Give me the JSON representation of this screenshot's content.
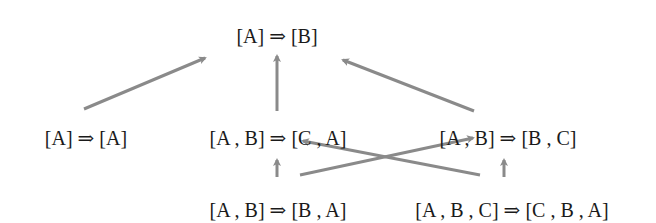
{
  "diagram": {
    "type": "hasse-diagram",
    "arrow_color": "#8a8a8a",
    "text_color": "#1a1a1a",
    "nodes": [
      {
        "id": "n_top",
        "label": "[A] ⇒ [B]",
        "x": 277,
        "y": 36
      },
      {
        "id": "n_aa",
        "label": "[A] ⇒ [A]",
        "x": 86,
        "y": 138
      },
      {
        "id": "n_ab_ca",
        "label": "[A , B] ⇒ [C , A]",
        "x": 278,
        "y": 138
      },
      {
        "id": "n_ab_bc",
        "label": "[A , B] ⇒ [B , C]",
        "x": 508,
        "y": 138
      },
      {
        "id": "n_ab_ba",
        "label": "[A , B] ⇒ [B , A]",
        "x": 278,
        "y": 210
      },
      {
        "id": "n_abc_cba",
        "label": "[A , B , C] ⇒ [C , B , A]",
        "x": 512,
        "y": 210
      }
    ],
    "edges": [
      {
        "from": "n_aa",
        "to": "n_top"
      },
      {
        "from": "n_ab_ca",
        "to": "n_top"
      },
      {
        "from": "n_ab_bc",
        "to": "n_top"
      },
      {
        "from": "n_ab_ba",
        "to": "n_ab_ca"
      },
      {
        "from": "n_ab_ba",
        "to": "n_ab_bc"
      },
      {
        "from": "n_abc_cba",
        "to": "n_ab_ca"
      },
      {
        "from": "n_abc_cba",
        "to": "n_ab_bc"
      }
    ]
  }
}
